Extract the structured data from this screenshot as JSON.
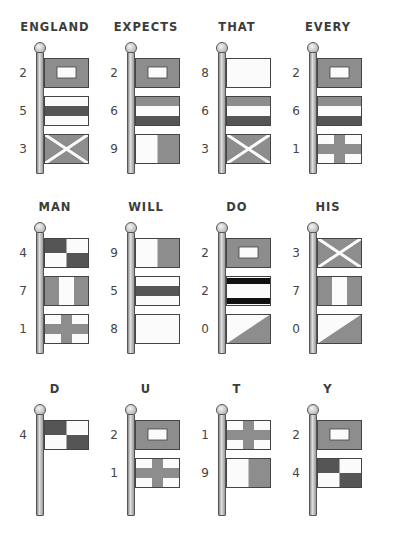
{
  "colors": {
    "flag_gray": "#8d8d8d",
    "flag_dark": "#555555",
    "flag_white": "#fbfbfb",
    "outline": "#444444",
    "text": "#3c3c3c"
  },
  "rows": [
    {
      "groups": [
        {
          "word": "ENGLAND",
          "digits": [
            "2",
            "5",
            "3"
          ]
        },
        {
          "word": "EXPECTS",
          "digits": [
            "2",
            "6",
            "9"
          ]
        },
        {
          "word": "THAT",
          "digits": [
            "8",
            "6",
            "3"
          ]
        },
        {
          "word": "EVERY",
          "digits": [
            "2",
            "6",
            "1"
          ]
        }
      ]
    },
    {
      "groups": [
        {
          "word": "MAN",
          "digits": [
            "4",
            "7",
            "1"
          ]
        },
        {
          "word": "WILL",
          "digits": [
            "9",
            "5",
            "8"
          ]
        },
        {
          "word": "DO",
          "digits": [
            "2",
            "2",
            "0"
          ]
        },
        {
          "word": "HIS",
          "digits": [
            "3",
            "7",
            "0"
          ]
        }
      ]
    },
    {
      "groups": [
        {
          "word": "D",
          "digits": [
            "4"
          ]
        },
        {
          "word": "U",
          "digits": [
            "2",
            "1"
          ]
        },
        {
          "word": "T",
          "digits": [
            "1",
            "9"
          ]
        },
        {
          "word": "Y",
          "digits": [
            "2",
            "4"
          ]
        }
      ]
    }
  ],
  "flag_patterns": {
    "0": "diagonal-split-white-gray",
    "1": "gray-cross-on-white",
    "2": "gray-with-white-rectangle",
    "3": "gray-with-white-saltire",
    "4": "dark-white-checker",
    "5": "white-dark-white-bands",
    "6": "gray-white-dark-bands",
    "7": "gray-white-gray-vertical",
    "8": "plain-white",
    "9": "white-gray-vertical",
    "2b": "white-with-black-top-bottom-bands"
  }
}
